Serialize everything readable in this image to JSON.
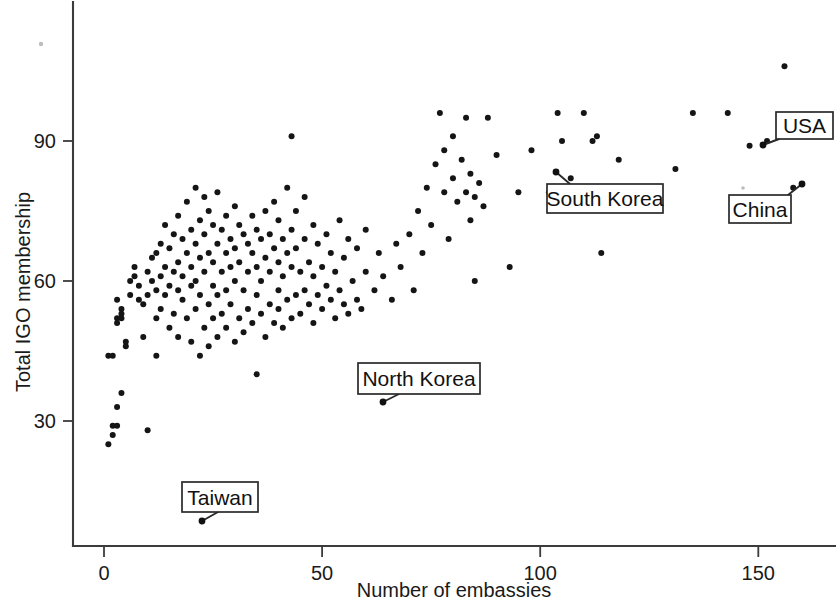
{
  "chart_data": {
    "type": "scatter",
    "title": "",
    "xlabel": "Number of embassies",
    "ylabel": "Total IGO membership",
    "xlim": [
      -5,
      168
    ],
    "ylim": [
      5,
      112
    ],
    "xticks": [
      0,
      50,
      100,
      150
    ],
    "yticks": [
      30,
      60,
      90
    ],
    "xtick_labels": [
      "0",
      "50",
      "100",
      "150"
    ],
    "ytick_labels": [
      "30",
      "60",
      "90"
    ],
    "grid": false,
    "legend": null,
    "marker": "filled-circle",
    "marker_color": "#151515",
    "points": [
      [
        1,
        25
      ],
      [
        2,
        27
      ],
      [
        2,
        29
      ],
      [
        3,
        29
      ],
      [
        3,
        33
      ],
      [
        4,
        36
      ],
      [
        1,
        44
      ],
      [
        2,
        44
      ],
      [
        3,
        51
      ],
      [
        3,
        52
      ],
      [
        4,
        52
      ],
      [
        4,
        53
      ],
      [
        4,
        54
      ],
      [
        3,
        56
      ],
      [
        5,
        47
      ],
      [
        5,
        46
      ],
      [
        6,
        57
      ],
      [
        6,
        60
      ],
      [
        7,
        61
      ],
      [
        7,
        63
      ],
      [
        8,
        56
      ],
      [
        8,
        59
      ],
      [
        9,
        48
      ],
      [
        9,
        55
      ],
      [
        10,
        28
      ],
      [
        10,
        57
      ],
      [
        10,
        62
      ],
      [
        11,
        60
      ],
      [
        11,
        65
      ],
      [
        12,
        44
      ],
      [
        12,
        52
      ],
      [
        12,
        58
      ],
      [
        12,
        66
      ],
      [
        13,
        54
      ],
      [
        13,
        61
      ],
      [
        13,
        68
      ],
      [
        14,
        57
      ],
      [
        14,
        63
      ],
      [
        14,
        72
      ],
      [
        15,
        50
      ],
      [
        15,
        59
      ],
      [
        15,
        67
      ],
      [
        16,
        53
      ],
      [
        16,
        62
      ],
      [
        16,
        70
      ],
      [
        17,
        48
      ],
      [
        17,
        58
      ],
      [
        17,
        64
      ],
      [
        17,
        74
      ],
      [
        18,
        56
      ],
      [
        18,
        61
      ],
      [
        18,
        69
      ],
      [
        19,
        52
      ],
      [
        19,
        66
      ],
      [
        19,
        77
      ],
      [
        20,
        47
      ],
      [
        20,
        59
      ],
      [
        20,
        63
      ],
      [
        20,
        71
      ],
      [
        21,
        54
      ],
      [
        21,
        60
      ],
      [
        21,
        68
      ],
      [
        21,
        80
      ],
      [
        22,
        44
      ],
      [
        22,
        57
      ],
      [
        22,
        65
      ],
      [
        22,
        73
      ],
      [
        23,
        50
      ],
      [
        23,
        62
      ],
      [
        23,
        70
      ],
      [
        23,
        78
      ],
      [
        24,
        46
      ],
      [
        24,
        55
      ],
      [
        24,
        66
      ],
      [
        24,
        75
      ],
      [
        25,
        52
      ],
      [
        25,
        59
      ],
      [
        25,
        64
      ],
      [
        25,
        72
      ],
      [
        26,
        48
      ],
      [
        26,
        57
      ],
      [
        26,
        68
      ],
      [
        26,
        79
      ],
      [
        27,
        53
      ],
      [
        27,
        62
      ],
      [
        27,
        71
      ],
      [
        28,
        50
      ],
      [
        28,
        58
      ],
      [
        28,
        66
      ],
      [
        28,
        74
      ],
      [
        29,
        55
      ],
      [
        29,
        63
      ],
      [
        29,
        69
      ],
      [
        30,
        47
      ],
      [
        30,
        60
      ],
      [
        30,
        67
      ],
      [
        30,
        76
      ],
      [
        31,
        52
      ],
      [
        31,
        64
      ],
      [
        31,
        72
      ],
      [
        32,
        49
      ],
      [
        32,
        58
      ],
      [
        32,
        70
      ],
      [
        33,
        54
      ],
      [
        33,
        62
      ],
      [
        33,
        68
      ],
      [
        34,
        51
      ],
      [
        34,
        66
      ],
      [
        34,
        74
      ],
      [
        35,
        40
      ],
      [
        35,
        57
      ],
      [
        35,
        63
      ],
      [
        35,
        71
      ],
      [
        36,
        53
      ],
      [
        36,
        60
      ],
      [
        36,
        69
      ],
      [
        37,
        48
      ],
      [
        37,
        65
      ],
      [
        37,
        75
      ],
      [
        38,
        55
      ],
      [
        38,
        62
      ],
      [
        38,
        70
      ],
      [
        39,
        51
      ],
      [
        39,
        67
      ],
      [
        39,
        77
      ],
      [
        40,
        54
      ],
      [
        40,
        58
      ],
      [
        40,
        64
      ],
      [
        40,
        73
      ],
      [
        41,
        50
      ],
      [
        41,
        61
      ],
      [
        41,
        69
      ],
      [
        42,
        56
      ],
      [
        42,
        66
      ],
      [
        42,
        80
      ],
      [
        43,
        52
      ],
      [
        43,
        63
      ],
      [
        43,
        71
      ],
      [
        43,
        91
      ],
      [
        44,
        57
      ],
      [
        44,
        67
      ],
      [
        44,
        75
      ],
      [
        45,
        53
      ],
      [
        45,
        62
      ],
      [
        46,
        58
      ],
      [
        46,
        69
      ],
      [
        46,
        78
      ],
      [
        47,
        55
      ],
      [
        47,
        64
      ],
      [
        48,
        51
      ],
      [
        48,
        61
      ],
      [
        48,
        72
      ],
      [
        49,
        57
      ],
      [
        49,
        68
      ],
      [
        50,
        54
      ],
      [
        50,
        63
      ],
      [
        51,
        59
      ],
      [
        51,
        70
      ],
      [
        52,
        56
      ],
      [
        52,
        66
      ],
      [
        53,
        52
      ],
      [
        53,
        62
      ],
      [
        54,
        58
      ],
      [
        54,
        73
      ],
      [
        55,
        55
      ],
      [
        55,
        65
      ],
      [
        56,
        53
      ],
      [
        56,
        69
      ],
      [
        57,
        60
      ],
      [
        58,
        56
      ],
      [
        58,
        67
      ],
      [
        59,
        54
      ],
      [
        60,
        62
      ],
      [
        60,
        71
      ],
      [
        62,
        58
      ],
      [
        63,
        66
      ],
      [
        64,
        61
      ],
      [
        65,
        41
      ],
      [
        66,
        56
      ],
      [
        67,
        68
      ],
      [
        68,
        63
      ],
      [
        70,
        70
      ],
      [
        71,
        58
      ],
      [
        72,
        75
      ],
      [
        73,
        66
      ],
      [
        74,
        80
      ],
      [
        75,
        72
      ],
      [
        76,
        85
      ],
      [
        77,
        96
      ],
      [
        78,
        88
      ],
      [
        78,
        79
      ],
      [
        79,
        69
      ],
      [
        80,
        82
      ],
      [
        80,
        91
      ],
      [
        81,
        77
      ],
      [
        82,
        86
      ],
      [
        83,
        79
      ],
      [
        83,
        95
      ],
      [
        84,
        73
      ],
      [
        84,
        83
      ],
      [
        85,
        78
      ],
      [
        85,
        60
      ],
      [
        86,
        81
      ],
      [
        87,
        76
      ],
      [
        88,
        95
      ],
      [
        90,
        87
      ],
      [
        93,
        63
      ],
      [
        95,
        79
      ],
      [
        98,
        88
      ],
      [
        102,
        79
      ],
      [
        104,
        96
      ],
      [
        105,
        90
      ],
      [
        107,
        82
      ],
      [
        110,
        96
      ],
      [
        112,
        90
      ],
      [
        113,
        91
      ],
      [
        114,
        66
      ],
      [
        118,
        86
      ],
      [
        131,
        84
      ],
      [
        135,
        96
      ],
      [
        143,
        96
      ],
      [
        148,
        89
      ],
      [
        152,
        90
      ],
      [
        156,
        106
      ],
      [
        158,
        80
      ]
    ],
    "annotations": [
      {
        "label": "Taiwan",
        "box_x": 182,
        "box_y": 482,
        "box_w": 76,
        "box_h": 30,
        "leader": [
          [
            218,
            512
          ],
          [
            202,
            521
          ]
        ],
        "point": [
          202,
          521
        ]
      },
      {
        "label": "North Korea",
        "box_x": 358,
        "box_y": 363,
        "box_w": 122,
        "box_h": 31,
        "leader": [
          [
            399,
            394
          ],
          [
            383,
            402
          ]
        ],
        "point": [
          383,
          402
        ]
      },
      {
        "label": "South Korea",
        "box_x": 547,
        "box_y": 184,
        "box_w": 116,
        "box_h": 29,
        "leader": [
          [
            570,
            184
          ],
          [
            556,
            172
          ]
        ],
        "point": [
          556,
          172
        ]
      },
      {
        "label": "USA",
        "box_x": 776,
        "box_y": 112,
        "box_w": 57,
        "box_h": 27,
        "leader": [
          [
            779,
            139
          ],
          [
            763,
            145
          ]
        ],
        "point": [
          763,
          145
        ]
      },
      {
        "label": "China",
        "box_x": 729,
        "box_y": 195,
        "box_w": 62,
        "box_h": 28,
        "leader": [
          [
            788,
            195
          ],
          [
            802,
            184
          ]
        ],
        "point": [
          802,
          184
        ]
      }
    ]
  },
  "axis": {
    "x_title": "Number of embassies",
    "y_title": "Total IGO membership"
  },
  "colors": {
    "marker": "#151515",
    "axis": "#3b3b3b",
    "text": "#1a1a1a",
    "callout_border": "#2a2a2a",
    "background": "#ffffff"
  }
}
